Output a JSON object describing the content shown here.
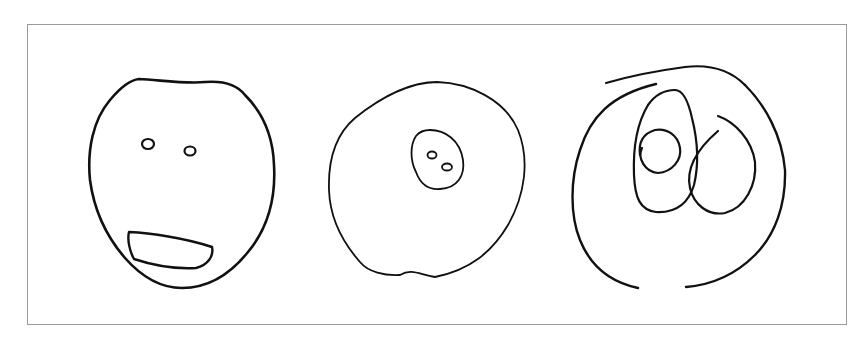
{
  "figure": {
    "background": "#ffffff",
    "frame_color": "#9a9a9a",
    "ink_color": "#111111",
    "drawings": [
      {
        "id": "face-with-eyes-and-mouth",
        "elements": [
          "head-outline",
          "left-eye",
          "right-eye",
          "mouth"
        ]
      },
      {
        "id": "circle-with-inner-face",
        "elements": [
          "outer-circle",
          "inner-oval",
          "inner-left-dot",
          "inner-right-dot"
        ]
      },
      {
        "id": "spiral-with-loops",
        "elements": [
          "outer-spiral",
          "tall-loop",
          "inner-spiral",
          "right-loop"
        ]
      }
    ]
  }
}
